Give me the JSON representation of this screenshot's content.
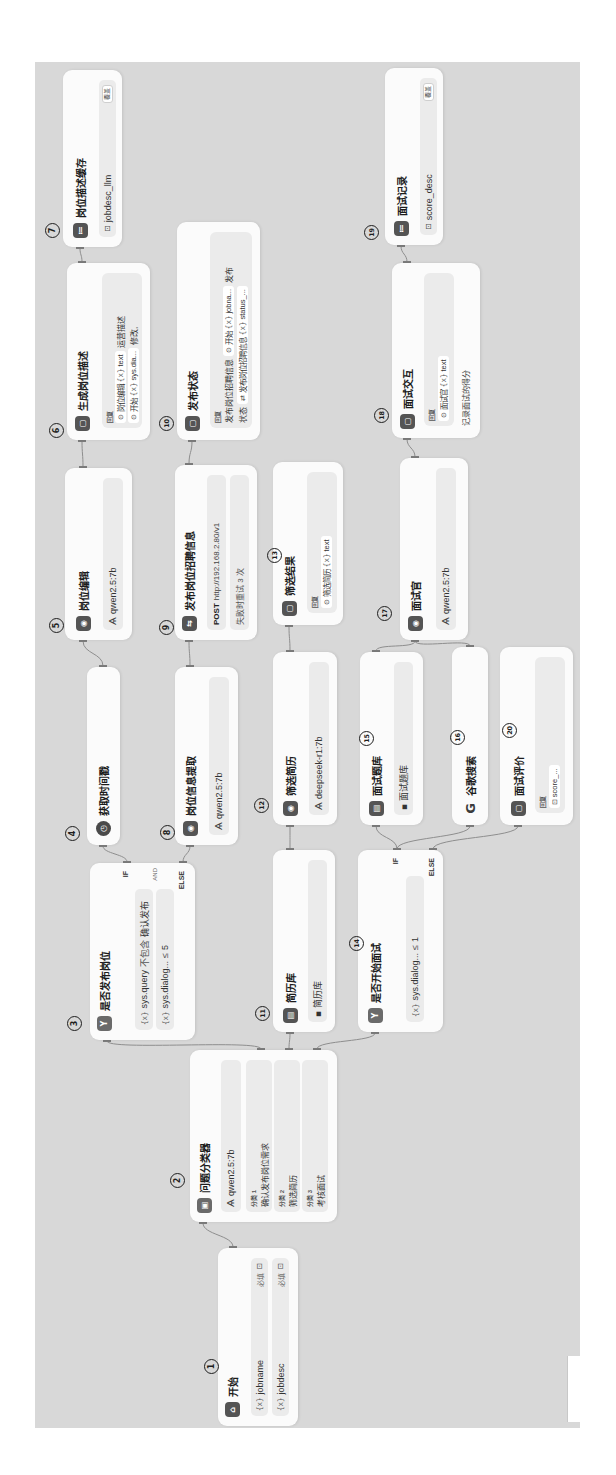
{
  "theme": {
    "canvas_bg": "#d8d8d8",
    "node_bg": "#fbfbfb",
    "row_bg": "#ebebeb",
    "icon_bg": "#545454",
    "edge": "#8e8e8e"
  },
  "icons": {
    "variable": "{x}",
    "node_ref": "⊙",
    "env_var": "⊡",
    "knowledge": "▪",
    "model": "Ѧ",
    "type_text": "⊡",
    "http": "⇄"
  },
  "workflow": {
    "nodes": [
      {
        "num": "1",
        "title": "开始",
        "icon": "⌂",
        "vars": [
          {
            "name": "jobname",
            "required": "必填"
          },
          {
            "name": "jobdesc",
            "required": "必填"
          }
        ]
      },
      {
        "num": "2",
        "title": "问题分类器",
        "icon": "▣",
        "model": "qwen2.5:7b",
        "classes": [
          {
            "label": "分类 1",
            "text": "确认发布岗位需求"
          },
          {
            "label": "分类 2",
            "text": "筛选简历"
          },
          {
            "label": "分类 3",
            "text": "考核面试"
          }
        ]
      },
      {
        "num": "3",
        "title": "是否发布岗位",
        "icon": "Y",
        "case_label": "IF",
        "logic": "AND",
        "else_label": "ELSE",
        "conditions": [
          {
            "var": "sys.query",
            "op": "不包含",
            "value": "确认发布"
          },
          {
            "var": "sys.dialog...",
            "op": "≤",
            "value": "5"
          }
        ]
      },
      {
        "num": "4",
        "title": "获取时间戳",
        "icon": "◷"
      },
      {
        "num": "5",
        "title": "岗位编辑",
        "icon": "◉",
        "model": "qwen2.5:7b"
      },
      {
        "num": "6",
        "title": "生成岗位描述",
        "icon": "▢",
        "reply_label": "回复",
        "lines": [
          {
            "ref_icon": "⊙",
            "ref_node": "岗位编辑",
            "ref_var": "text",
            "suffix": "运营描述"
          },
          {
            "ref_icon": "⊙",
            "ref_node": "开始",
            "ref_var": "sys.dia...",
            "suffix": "修改,"
          }
        ]
      },
      {
        "num": "7",
        "title": "岗位描述缓存",
        "icon": "≔",
        "var": "jobdesc_llm",
        "mode": "覆盖"
      },
      {
        "num": "8",
        "title": "岗位信息提取",
        "icon": "◉",
        "model": "qwen2.5:7b"
      },
      {
        "num": "9",
        "title": "发布岗位招聘信息",
        "icon": "⇆",
        "method": "POST",
        "url": "http://192.168.2.80/v1",
        "retry": "失败时重试 3 次"
      },
      {
        "num": "10",
        "title": "发布状态",
        "icon": "▢",
        "reply_label": "回复",
        "lines": [
          {
            "prefix": "发布岗位招聘信息",
            "ref_icon": "⊙",
            "ref_node": "开始",
            "ref_var": "jobna...",
            "suffix": "发布"
          },
          {
            "prefix": "状态",
            "ref_icon": "⇄",
            "ref_node": "发布岗位招聘信息",
            "ref_var": "status_..."
          }
        ]
      },
      {
        "num": "11",
        "title": "简历库",
        "icon": "▤",
        "knowledge": "简历库"
      },
      {
        "num": "12",
        "title": "筛选简历",
        "icon": "◉",
        "model": "deepseek-r1:7b"
      },
      {
        "num": "13",
        "title": "筛选结果",
        "icon": "▢",
        "reply_label": "回复",
        "lines": [
          {
            "ref_icon": "⊙",
            "ref_node": "筛选简历",
            "ref_var": "text"
          }
        ]
      },
      {
        "num": "14",
        "title": "是否开始面试",
        "icon": "Y",
        "case_label": "IF",
        "else_label": "ELSE",
        "conditions": [
          {
            "var": "sys.dialog...",
            "op": "≤",
            "value": "1"
          }
        ]
      },
      {
        "num": "15",
        "title": "面试题库",
        "icon": "▤",
        "knowledge": "面试题库"
      },
      {
        "num": "16",
        "title": "谷歌搜索",
        "icon": "G"
      },
      {
        "num": "17",
        "title": "面试官",
        "icon": "◉",
        "model": "qwen2.5:7b"
      },
      {
        "num": "18",
        "title": "面试交互",
        "icon": "▢",
        "reply_label": "回复",
        "lines": [
          {
            "ref_icon": "⊙",
            "ref_node": "面试官",
            "ref_var": "text"
          }
        ],
        "description": "记录面试的得分"
      },
      {
        "num": "19",
        "title": "面试记录",
        "icon": "≔",
        "var": "score_desc",
        "mode": "覆盖"
      },
      {
        "num": "20",
        "title": "面试评价",
        "icon": "▢",
        "reply_label": "回复",
        "lines": [
          {
            "env_var": "score_..."
          }
        ]
      }
    ]
  }
}
